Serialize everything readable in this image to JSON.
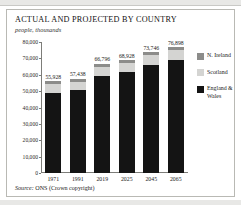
{
  "title": "ACTUAL AND PROJECTED BY COUNTRY",
  "subtitle": "people, thousands",
  "source": {
    "label": "Source:",
    "text": "ONS (Crown copyright)"
  },
  "legend": {
    "items": [
      {
        "label": "N. Ireland",
        "color": "#8c8c8a"
      },
      {
        "label": "Scotland",
        "color": "#d4d4d2"
      },
      {
        "label": "England & Wales",
        "color": "#141414"
      }
    ]
  },
  "axis": {
    "yticks": [
      "80,000",
      "70,000",
      "60,000",
      "50,000",
      "40,000",
      "30,000",
      "20,000",
      "10,000",
      "0"
    ],
    "xticks": [
      "1971",
      "1991",
      "2019",
      "2025",
      "2045",
      "2065"
    ]
  },
  "bar_totals": [
    "55,928",
    "57,438",
    "66,796",
    "68,928",
    "73,746",
    "76,898"
  ],
  "chart_data": {
    "type": "bar",
    "subtype": "stacked-column",
    "title": "ACTUAL AND PROJECTED BY COUNTRY",
    "subtitle": "people, thousands",
    "xlabel": "",
    "ylabel": "people, thousands",
    "ylim": [
      0,
      80000
    ],
    "ytick_step": 10000,
    "yticks": [
      0,
      10000,
      20000,
      30000,
      40000,
      50000,
      60000,
      70000,
      80000
    ],
    "grid": false,
    "legend_position": "right",
    "categories": [
      "1971",
      "1991",
      "2019",
      "2025",
      "2045",
      "2065"
    ],
    "series": [
      {
        "name": "England & Wales",
        "color": "#141414",
        "values": [
          49152,
          50748,
          59440,
          61420,
          66050,
          69100
        ]
      },
      {
        "name": "Scotland",
        "color": "#d4d4d2",
        "values": [
          5236,
          5083,
          5463,
          5576,
          5800,
          5910
        ]
      },
      {
        "name": "N. Ireland",
        "color": "#8c8c8a",
        "values": [
          1540,
          1607,
          1893,
          1932,
          1896,
          1888
        ]
      }
    ],
    "totals": [
      55928,
      57438,
      66796,
      68928,
      73746,
      76898
    ],
    "data_labels": [
      "55,928",
      "57,438",
      "66,796",
      "68,928",
      "73,746",
      "76,898"
    ],
    "source": "Source: ONS (Crown copyright)"
  }
}
